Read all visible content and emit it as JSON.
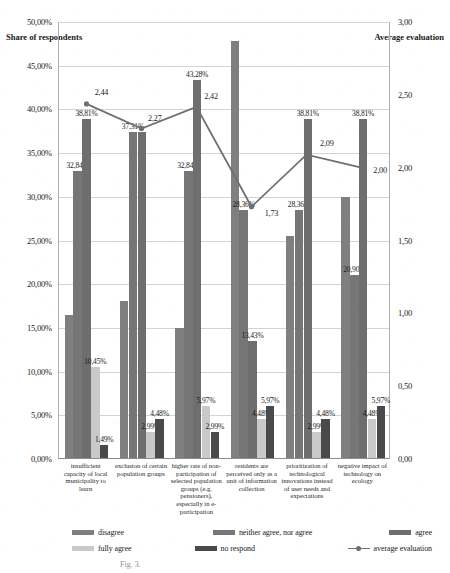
{
  "axis": {
    "left_title": "Share of respondents",
    "right_title": "Average evaluation",
    "left_ticks": [
      "0,00%",
      "5,00%",
      "10,00%",
      "15,00%",
      "20,00%",
      "25,00%",
      "30,00%",
      "35,00%",
      "40,00%",
      "45,00%",
      "50,00%"
    ],
    "right_ticks": [
      "0,00",
      "0,50",
      "1,00",
      "1,50",
      "2,00",
      "2,50",
      "3,00"
    ]
  },
  "legend": {
    "items": [
      {
        "label": "disagree",
        "color": "#7f7f7f"
      },
      {
        "label": "neither agree, nor agree",
        "color": "#767676"
      },
      {
        "label": "agree",
        "color": "#6e6e6e"
      },
      {
        "label": "fully agree",
        "color": "#c9c9c9"
      },
      {
        "label": "no respond",
        "color": "#4a4a4a"
      },
      {
        "label": "average evaluation",
        "color": "#6f6f6f"
      }
    ]
  },
  "caption": "Fig. 3.",
  "chart_data": {
    "type": "bar",
    "title": "",
    "xlabel": "",
    "ylabel": "Share of respondents",
    "y2label": "Average evaluation",
    "ylim": [
      0,
      50
    ],
    "y2lim": [
      0,
      3
    ],
    "grid": true,
    "legend_position": "bottom",
    "categories": [
      "insufficient capacity of local municipality to learn",
      "exclusion of certain population groups",
      "higher rate of non-participation of selected population groups (e.g. pensioners), especially in e-participation",
      "residents are perceived only as a unit of information collection",
      "prioritization of technological innovations instead of user needs and expectations",
      "negative impact of technology on ecology"
    ],
    "series": [
      {
        "name": "disagree",
        "color": "#7f7f7f",
        "values": [
          16.42,
          17.91,
          14.93,
          47.76,
          25.37,
          29.85
        ],
        "labels": [
          "",
          "",
          "",
          "",
          "",
          ""
        ]
      },
      {
        "name": "neither agree, nor agree",
        "color": "#767676",
        "values": [
          32.84,
          37.31,
          32.84,
          28.36,
          28.36,
          20.9
        ],
        "labels": [
          "32,84%",
          "37,31%",
          "32,84%",
          "28,36%",
          "28,36%",
          "20,90%"
        ]
      },
      {
        "name": "agree",
        "color": "#6e6e6e",
        "values": [
          38.81,
          37.31,
          43.28,
          13.43,
          38.81,
          38.81
        ],
        "labels": [
          "38,81%",
          "",
          "43,28%",
          "13,43%",
          "38,81%",
          "38,81%"
        ]
      },
      {
        "name": "fully agree",
        "color": "#c9c9c9",
        "values": [
          10.45,
          2.99,
          5.97,
          4.48,
          2.99,
          4.48
        ],
        "labels": [
          "10,45%",
          "2,99%",
          "5,97%",
          "4,48%",
          "2,99%",
          "4,48%"
        ]
      },
      {
        "name": "no respond",
        "color": "#4a4a4a",
        "values": [
          1.49,
          4.48,
          2.99,
          5.97,
          4.48,
          5.97
        ],
        "labels": [
          "1,49%",
          "4,48%",
          "2,99%",
          "5,97%",
          "4,48%",
          "5,97%"
        ]
      }
    ],
    "line_series": {
      "name": "average evaluation",
      "color": "#6f6f6f",
      "axis": "secondary",
      "values": [
        2.44,
        2.27,
        2.42,
        1.73,
        2.09,
        2.0
      ],
      "labels": [
        "2,44",
        "2,27",
        "2,42",
        "1,73",
        "2,09",
        "2,00"
      ]
    }
  }
}
